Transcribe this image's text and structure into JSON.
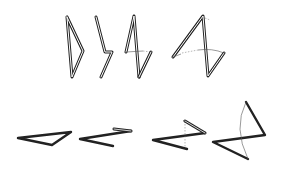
{
  "diagram": {
    "title": "",
    "background": "#ffffff",
    "stroke_color": "#222222",
    "rows": [
      {
        "name": "top-row",
        "style": "double-line ribbon",
        "figures": [
          {
            "id": "fig-1",
            "points": [
              [
                67,
                17
              ],
              [
                83,
                51
              ],
              [
                72,
                77
              ],
              [
                67,
                17
              ]
            ],
            "closed": true
          },
          {
            "id": "fig-2",
            "points": [
              [
                96,
                17
              ],
              [
                105,
                52
              ],
              [
                112,
                52
              ],
              [
                101,
                77
              ]
            ],
            "closed": false
          },
          {
            "id": "fig-3",
            "points": [
              [
                134,
                16
              ],
              [
                126,
                52
              ],
              [
                151,
                52
              ],
              [
                139,
                77
              ]
            ],
            "closed": false,
            "extra": [
              [
                134,
                16
              ],
              [
                139,
                77
              ]
            ]
          },
          {
            "id": "fig-4",
            "points": [
              [
                173,
                57
              ],
              [
                203,
                16
              ],
              [
                208,
                76
              ],
              [
                224,
                53
              ],
              [
                190,
                50
              ]
            ],
            "closed": false
          }
        ]
      },
      {
        "name": "bottom-row",
        "style": "thick solid",
        "figures": [
          {
            "id": "fig-5",
            "points": [
              [
                18,
                138
              ],
              [
                71,
                132
              ],
              [
                52,
                145
              ],
              [
                18,
                138
              ]
            ],
            "closed": true
          },
          {
            "id": "fig-6",
            "points": [
              [
                113,
                146
              ],
              [
                80,
                139
              ],
              [
                131,
                131
              ],
              [
                118,
                129
              ]
            ],
            "closed": false
          },
          {
            "id": "fig-7",
            "points": [
              [
                187,
                149
              ],
              [
                153,
                140
              ],
              [
                205,
                133
              ],
              [
                185,
                121
              ]
            ],
            "closed": false,
            "dashed": [
              [
                185,
                121
              ],
              [
                185,
                149
              ]
            ]
          },
          {
            "id": "fig-8",
            "points": [
              [
                248,
                159
              ],
              [
                213,
                142
              ],
              [
                265,
                135
              ],
              [
                246,
                102
              ]
            ],
            "closed": false,
            "arc": "M246,102 Q232,130 248,159"
          }
        ]
      }
    ]
  }
}
